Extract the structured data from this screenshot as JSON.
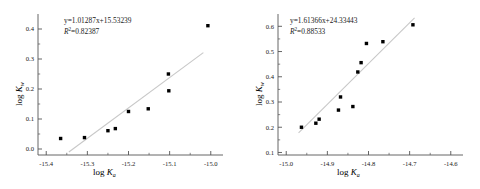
{
  "figure": {
    "background": "#ffffff",
    "marker_color": "#000000",
    "fit_line_color": "#c8c8c8",
    "axis_color": "#555555"
  },
  "panels": [
    {
      "id": "left",
      "equation": "y=1.01287x+15.53239",
      "equation_slope": 1.01287,
      "equation_intercept": 15.53239,
      "r2_label": "R",
      "r2_exponent": "2",
      "r2_text": "=0.82387",
      "r2_value": 0.82387,
      "xlabel_prefix": "log ",
      "xlabel_symbol": "K",
      "xlabel_sub": "a",
      "ylabel_prefix": "log ",
      "ylabel_symbol": "K",
      "ylabel_sub": "w",
      "xticks": [
        "-15.4",
        "-15.3",
        "-15.2",
        "-15.1",
        "-15.0"
      ],
      "xtick_values": [
        -15.4,
        -15.3,
        -15.2,
        -15.1,
        -15.0
      ],
      "yticks": [
        "0.0",
        "0.1",
        "0.2",
        "0.3",
        "0.4"
      ],
      "ytick_values": [
        0.0,
        0.1,
        0.2,
        0.3,
        0.4
      ]
    },
    {
      "id": "right",
      "equation": "y=1.61366x+24.33443",
      "equation_slope": 1.61366,
      "equation_intercept": 24.33443,
      "r2_label": "R",
      "r2_exponent": "2",
      "r2_text": "=0.88533",
      "r2_value": 0.88533,
      "xlabel_prefix": "log ",
      "xlabel_symbol": "K",
      "xlabel_sub": "a",
      "ylabel_prefix": "log ",
      "ylabel_symbol": "K",
      "ylabel_sub": "w",
      "xticks": [
        "-15.0",
        "-14.9",
        "-14.8",
        "-14.7",
        "-14.6"
      ],
      "xtick_values": [
        -15.0,
        -14.9,
        -14.8,
        -14.7,
        -14.6
      ],
      "yticks": [
        "0.1",
        "0.2",
        "0.3",
        "0.4",
        "0.5",
        "0.6"
      ],
      "ytick_values": [
        0.1,
        0.2,
        0.3,
        0.4,
        0.5,
        0.6
      ]
    }
  ],
  "chart_data": [
    {
      "type": "scatter",
      "title": "",
      "xlabel": "log Ka",
      "ylabel": "log Kw",
      "xlim": [
        -15.42,
        -14.98
      ],
      "ylim": [
        -0.02,
        0.43
      ],
      "grid": false,
      "legend": "none",
      "annotations": [
        "y=1.01287x+15.53239",
        "R2=0.82387"
      ],
      "x": [
        -15.365,
        -15.307,
        -15.25,
        -15.232,
        -15.2,
        -15.152,
        -15.103,
        -15.102,
        -15.007
      ],
      "y": [
        0.035,
        0.038,
        0.061,
        0.068,
        0.125,
        0.134,
        0.25,
        0.194,
        0.411
      ],
      "fit": {
        "slope": 1.01287,
        "intercept": 15.53239,
        "r2": 0.82387,
        "x_start": -15.345,
        "x_end": -15.018
      }
    },
    {
      "type": "scatter",
      "title": "",
      "xlabel": "log Ka",
      "ylabel": "log Kw",
      "xlim": [
        -15.02,
        -14.58
      ],
      "ylim": [
        0.09,
        0.625
      ],
      "grid": false,
      "legend": "none",
      "annotations": [
        "y=1.61366x+24.33443",
        "R2=0.88533"
      ],
      "x": [
        -14.963,
        -14.928,
        -14.92,
        -14.873,
        -14.868,
        -14.838,
        -14.826,
        -14.818,
        -14.805,
        -14.765,
        -14.692
      ],
      "y": [
        0.2,
        0.216,
        0.232,
        0.268,
        0.32,
        0.282,
        0.419,
        0.456,
        0.532,
        0.539,
        0.606
      ],
      "fit": {
        "slope": 1.61366,
        "intercept": 24.33443,
        "r2": 0.88533,
        "x_start": -14.97,
        "x_end": -14.688
      }
    }
  ]
}
